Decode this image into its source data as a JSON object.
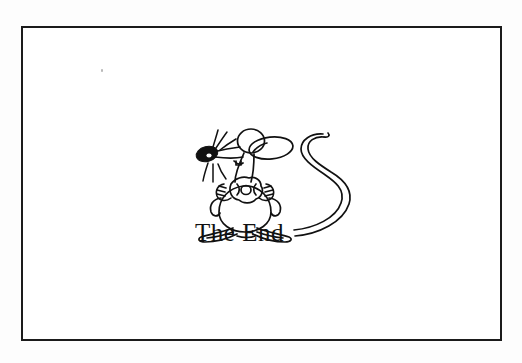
{
  "document": {
    "title": "The End",
    "caption": "The End",
    "background_color": "#fdfdfd",
    "card_background_color": "#ffffff",
    "ink_color": "#111111",
    "border_color": "#1b1b1b"
  },
  "illustration": {
    "name": "cartoon-mouse",
    "description": "Line-art cartoon mouse standing upright holding a round piece of food, with a long curling tail",
    "parts": [
      "nose",
      "whiskers",
      "head",
      "ear",
      "eye",
      "mouth",
      "neck",
      "arms",
      "hands",
      "held-object",
      "body",
      "feet",
      "tail"
    ]
  },
  "frame": {
    "x": 21,
    "y": 26,
    "width": 481,
    "height": 315,
    "stroke_width": 2
  },
  "artifacts": [
    {
      "name": "scan-speck",
      "x": 78,
      "y": 41
    }
  ]
}
